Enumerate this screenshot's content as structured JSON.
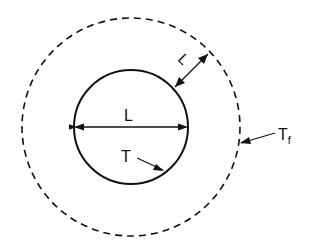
{
  "diagram": {
    "labels": {
      "diameter": "L",
      "gap": "L",
      "surface_temp": "T",
      "fluid_temp_main": "T",
      "fluid_temp_sub": "f"
    },
    "stroke_color": "#111111",
    "background": "#ffffff"
  }
}
